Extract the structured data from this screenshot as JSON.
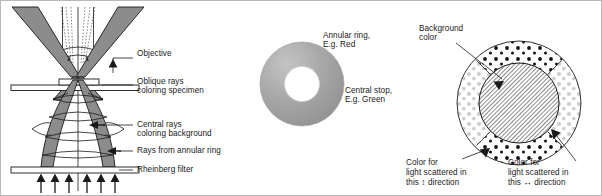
{
  "figure": {
    "panels": [
      "optical-path",
      "rheinberg-filter",
      "specimen-view"
    ]
  },
  "colors": {
    "beam_fill": "#8c8c8c",
    "beam_stroke": "#1a1a1a",
    "line": "#1a1a1a",
    "ring_outer": "#9a9a9a",
    "ring_inner": "#ffffff",
    "dots_dark": "#111111",
    "dots_light": "#c9c9c9",
    "hatch": "#2b2b2b",
    "frame": "#b9b9b9",
    "text": "#1a1a1a"
  },
  "left_panel": {
    "name": "optical-path-diagram",
    "labels": {
      "objective": "Objective",
      "oblique_rays_line1": "Oblique rays",
      "oblique_rays_line2": "coloring specimen",
      "central_rays_line1": "Central rays",
      "central_rays_line2": "coloring background",
      "rays_from_annular_ring": "Rays from annular ring",
      "rheinberg_filter": "Rheinberg filter"
    },
    "arrow_count_bottom": 6
  },
  "mid_panel": {
    "name": "rheinberg-filter-diagram",
    "labels": {
      "annular_ring_line1": "Annular ring,",
      "annular_ring_line2": "E.g. Red",
      "central_stop_line1": "Central stop,",
      "central_stop_line2": "E.g. Green"
    }
  },
  "right_panel": {
    "name": "specimen-view-diagram",
    "labels": {
      "background_color_line1": "Background",
      "background_color_line2": "color",
      "scatter_vertical_line1": "Color for",
      "scatter_vertical_line2": "light scattered in",
      "scatter_vertical_line3_pre": "this ",
      "scatter_vertical_arrow": "↕",
      "scatter_vertical_line3_post": " direction",
      "scatter_horizontal_line1": "Color for",
      "scatter_horizontal_line2": "light scattered in",
      "scatter_horizontal_line3_pre": "this ",
      "scatter_horizontal_arrow": "↔",
      "scatter_horizontal_line3_post": " direction"
    }
  }
}
